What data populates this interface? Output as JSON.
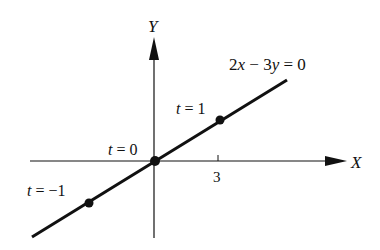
{
  "diagram": {
    "axes": {
      "x_label": "X",
      "y_label": "Y",
      "x_tick_label": "3"
    },
    "line": {
      "equation": "2x − 3y = 0"
    },
    "points": [
      {
        "label": "t = 1"
      },
      {
        "label": "t = 0"
      },
      {
        "label": "t = −1"
      }
    ],
    "colors": {
      "ink": "#111111",
      "background": "#ffffff"
    }
  },
  "chart_data": {
    "type": "line",
    "title": "2x − 3y = 0",
    "xlabel": "X",
    "ylabel": "Y",
    "x_ticks": [
      3
    ],
    "series": [
      {
        "name": "2x − 3y = 0",
        "x": [
          -3,
          0,
          3
        ],
        "y": [
          -2,
          0,
          2
        ],
        "point_labels": [
          "t = −1",
          "t = 0",
          "t = 1"
        ]
      }
    ],
    "grid": false
  }
}
